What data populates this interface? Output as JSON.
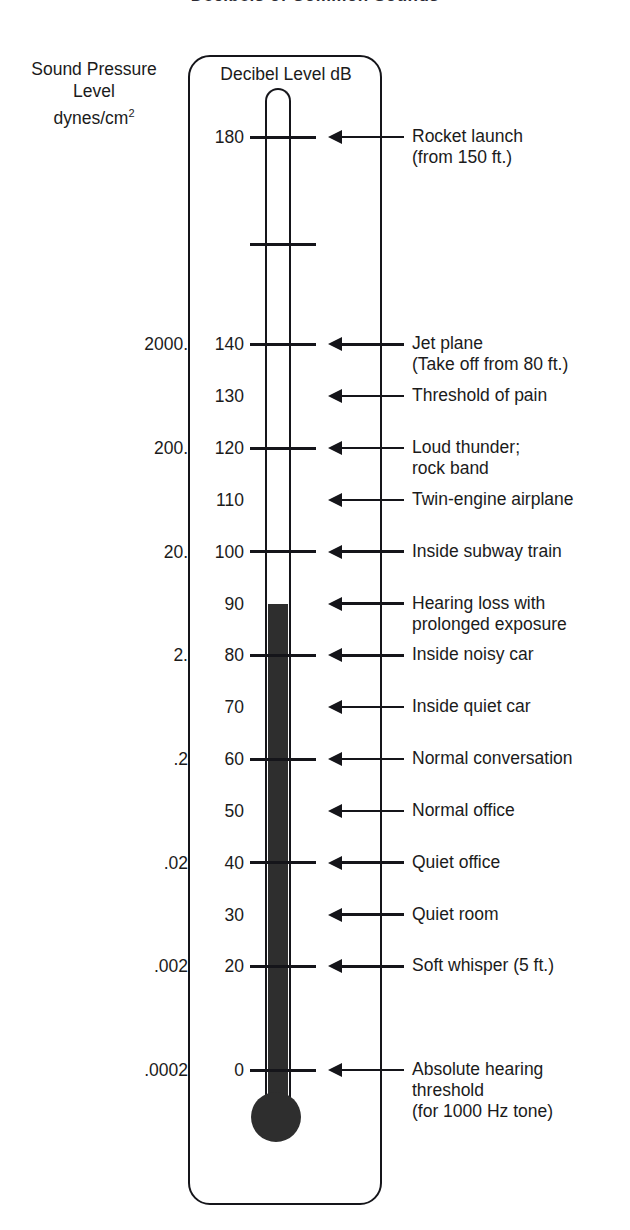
{
  "title": "Decibels of Common Sounds",
  "left_header": {
    "line1": "Sound Pressure",
    "line2": "Level",
    "line3_base": "dynes/cm",
    "line3_sup": "2"
  },
  "frame_title": "Decibel Level dB",
  "colors": {
    "ink": "#15151a",
    "mercury": "#2e2e2e",
    "background": "#ffffff"
  },
  "chart_data": {
    "type": "table",
    "title": "Decibels of Common Sounds",
    "xlabel": "",
    "ylabel": "Decibel Level dB",
    "axis_secondary_label": "Sound Pressure Level dynes/cm2",
    "ylim": [
      0,
      180
    ],
    "grid": false,
    "legend": "none",
    "mercury_fill_top_db": 90,
    "rows": [
      {
        "db": "180",
        "pressure": "",
        "tick": true,
        "arrow": true,
        "label_lines": [
          "Rocket launch",
          "(from 150 ft.)"
        ]
      },
      {
        "db": "",
        "pressure": "",
        "tick": true,
        "arrow": false,
        "label_lines": []
      },
      {
        "db": "140",
        "pressure": "2000.",
        "tick": true,
        "arrow": true,
        "label_lines": [
          "Jet plane",
          "(Take off from 80 ft.)"
        ]
      },
      {
        "db": "130",
        "pressure": "",
        "tick": false,
        "arrow": true,
        "label_lines": [
          "Threshold of pain"
        ]
      },
      {
        "db": "120",
        "pressure": "200.",
        "tick": true,
        "arrow": true,
        "label_lines": [
          "Loud thunder;",
          "rock band"
        ]
      },
      {
        "db": "110",
        "pressure": "",
        "tick": false,
        "arrow": true,
        "label_lines": [
          "Twin-engine airplane"
        ]
      },
      {
        "db": "100",
        "pressure": "20.",
        "tick": true,
        "arrow": true,
        "label_lines": [
          "Inside subway train"
        ]
      },
      {
        "db": "90",
        "pressure": "",
        "tick": false,
        "arrow": true,
        "label_lines": [
          "Hearing loss with",
          "prolonged exposure"
        ]
      },
      {
        "db": "80",
        "pressure": "2.",
        "tick": true,
        "arrow": true,
        "label_lines": [
          "Inside noisy car"
        ]
      },
      {
        "db": "70",
        "pressure": "",
        "tick": false,
        "arrow": true,
        "label_lines": [
          "Inside quiet car"
        ]
      },
      {
        "db": "60",
        "pressure": ".2",
        "tick": true,
        "arrow": true,
        "label_lines": [
          "Normal conversation"
        ]
      },
      {
        "db": "50",
        "pressure": "",
        "tick": false,
        "arrow": true,
        "label_lines": [
          "Normal office"
        ]
      },
      {
        "db": "40",
        "pressure": ".02",
        "tick": true,
        "arrow": true,
        "label_lines": [
          "Quiet office"
        ]
      },
      {
        "db": "30",
        "pressure": "",
        "tick": false,
        "arrow": true,
        "label_lines": [
          "Quiet room"
        ]
      },
      {
        "db": "20",
        "pressure": ".002",
        "tick": true,
        "arrow": true,
        "label_lines": [
          "Soft whisper (5 ft.)"
        ]
      },
      {
        "db": "0",
        "pressure": ".0002",
        "tick": true,
        "arrow": true,
        "label_lines": [
          "Absolute hearing",
          "threshold",
          "(for 1000 Hz tone)"
        ]
      }
    ]
  }
}
